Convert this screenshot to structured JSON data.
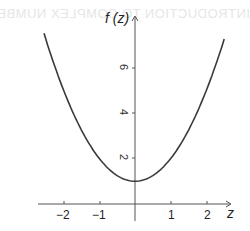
{
  "bleed_through": {
    "header": "INTRODUCTION TO COMPLEX NUMBERS",
    "lines": [
      "",
      "",
      "",
      "",
      "",
      "",
      "",
      "",
      ""
    ]
  },
  "chart_data": {
    "type": "line",
    "title": "",
    "function": "f(z) = z^2 + 1",
    "xlabel": "z",
    "ylabel": "f (z)",
    "xlim": [
      -2.5,
      2.5
    ],
    "ylim": [
      0,
      7.5
    ],
    "xticks": [
      -2,
      -1,
      1,
      2
    ],
    "xtick_labels": [
      "−2",
      "−1",
      "1",
      "2"
    ],
    "yticks": [
      2,
      4,
      6
    ],
    "ytick_labels": [
      "2",
      "4",
      "6"
    ],
    "grid": false,
    "legend": null,
    "series": [
      {
        "name": "f(z)",
        "x": [
          -2.5,
          -2.0,
          -1.5,
          -1.0,
          -0.5,
          0.0,
          0.5,
          1.0,
          1.5,
          2.0,
          2.5
        ],
        "y": [
          7.25,
          5.0,
          3.25,
          2.0,
          1.25,
          1.0,
          1.25,
          2.0,
          3.25,
          5.0,
          7.25
        ],
        "color": "#3a3a3a"
      }
    ],
    "colors": {
      "axis": "#555555",
      "curve": "#3a3a3a",
      "text": "#222222"
    }
  }
}
